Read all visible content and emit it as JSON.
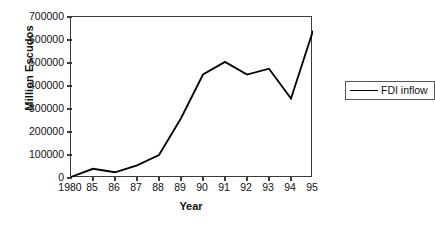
{
  "chart_data": {
    "type": "line",
    "title": "",
    "xlabel": "Year",
    "ylabel": "Million Escudos",
    "categories": [
      "1980",
      "85",
      "86",
      "87",
      "88",
      "89",
      "90",
      "91",
      "92",
      "93",
      "94",
      "95"
    ],
    "series": [
      {
        "name": "FDI inflow",
        "values": [
          5000,
          40000,
          25000,
          55000,
          100000,
          260000,
          450000,
          505000,
          450000,
          475000,
          345000,
          640000
        ]
      }
    ],
    "ylim": [
      0,
      700000
    ],
    "yticks": [
      0,
      100000,
      200000,
      300000,
      400000,
      500000,
      600000,
      700000
    ],
    "ytick_labels": [
      "0",
      "100000",
      "200000",
      "300000",
      "400000",
      "500000",
      "600000",
      "700000"
    ],
    "grid": false,
    "legend": {
      "position": "right",
      "entries": [
        "FDI inflow"
      ]
    },
    "line_color": "#000000",
    "frame_color": "#3b3b3b"
  }
}
